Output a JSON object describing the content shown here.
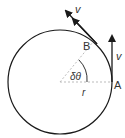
{
  "diagram": {
    "type": "circular-motion",
    "labels": {
      "point_a": "A",
      "point_b": "B",
      "velocity_a": "v",
      "velocity_b": "v",
      "angle": "δθ",
      "radius": "r"
    },
    "colors": {
      "stroke": "#1a1a1a",
      "dashed": "#bbbbbb",
      "text": "#333333"
    }
  }
}
